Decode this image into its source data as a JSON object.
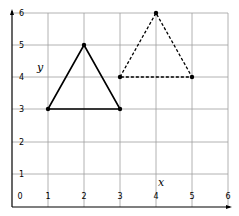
{
  "diagram": {
    "type": "coordinate-grid-translation",
    "axes": {
      "x_label": "x",
      "y_label": "y",
      "x_range": [
        0,
        6
      ],
      "y_range": [
        0,
        6
      ],
      "x_ticks": [
        "0",
        "1",
        "2",
        "3",
        "4",
        "5",
        "6"
      ],
      "y_ticks": [
        "1",
        "2",
        "3",
        "4",
        "5",
        "6"
      ]
    },
    "shapes": [
      {
        "name": "original-triangle",
        "style": "solid",
        "vertices": [
          [
            1,
            3
          ],
          [
            2,
            5
          ],
          [
            3,
            3
          ]
        ]
      },
      {
        "name": "translated-triangle",
        "style": "dashed",
        "vertices": [
          [
            3,
            4
          ],
          [
            4,
            6
          ],
          [
            5,
            4
          ]
        ]
      }
    ],
    "colors": {
      "grid": "#9a9a9a",
      "axis": "#000000",
      "shape": "#000000"
    }
  }
}
